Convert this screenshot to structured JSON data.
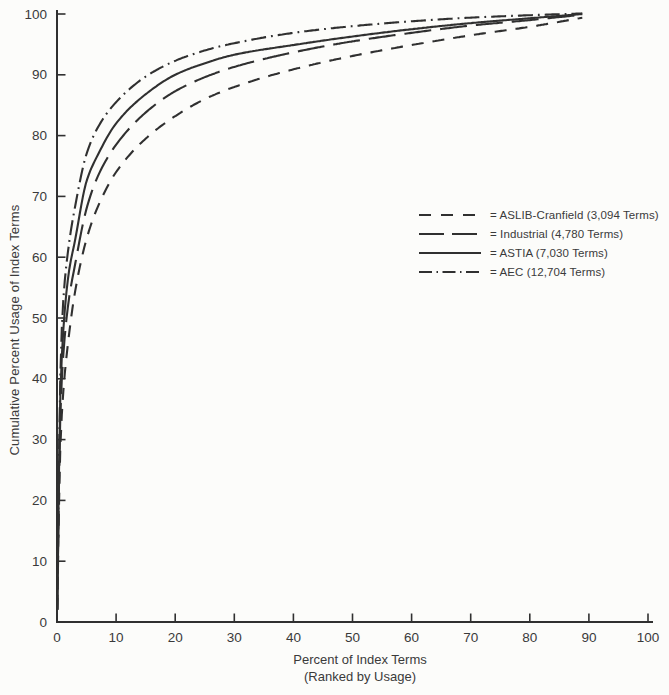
{
  "figure": {
    "background_color": "#fcfcfa",
    "ink_color": "#303030"
  },
  "chart_data": {
    "type": "line",
    "title": "",
    "xlabel": "Percent of Index Terms",
    "xlabel_note": "(Ranked by Usage)",
    "ylabel": "Cumulative Percent Usage of Index Terms",
    "xlim": [
      0,
      100
    ],
    "ylim": [
      0,
      100
    ],
    "x_ticks": [
      0,
      10,
      20,
      30,
      40,
      50,
      60,
      70,
      80,
      90,
      100
    ],
    "y_ticks": [
      0,
      10,
      20,
      30,
      40,
      50,
      60,
      70,
      80,
      90,
      100
    ],
    "grid": false,
    "legend_position": "center-right",
    "x": [
      0.05,
      0.5,
      1,
      2,
      3,
      5,
      7,
      10,
      15,
      20,
      25,
      30,
      40,
      50,
      60,
      70,
      80,
      89
    ],
    "series": [
      {
        "name": "ASLIB-Cranfield",
        "terms_count": "3,094",
        "legend_label": "= ASLIB-Cranfield (3,094 Terms)",
        "line_style": "short-dash",
        "values": [
          2,
          27,
          37,
          47,
          54,
          63,
          68.5,
          74,
          79.5,
          83.2,
          86,
          88,
          90.9,
          93.1,
          94.9,
          96.5,
          97.9,
          99.4
        ]
      },
      {
        "name": "Industrial",
        "terms_count": "4,780",
        "legend_label": "= Industrial (4,780 Terms)",
        "line_style": "long-dash",
        "values": [
          2,
          32,
          43,
          53,
          58.5,
          68,
          73.5,
          78.5,
          83.8,
          87.3,
          89.6,
          91.3,
          93.7,
          95.5,
          96.9,
          98.1,
          99,
          99.9
        ]
      },
      {
        "name": "ASTIA",
        "terms_count": "7,030",
        "legend_label": "= ASTIA (7,030 Terms)",
        "line_style": "solid",
        "values": [
          2,
          35,
          47,
          57.5,
          62.5,
          72.5,
          77,
          82,
          86.8,
          90,
          91.9,
          93.3,
          94.9,
          96.3,
          97.5,
          98.5,
          99.3,
          100
        ]
      },
      {
        "name": "AEC",
        "terms_count": "12,704",
        "legend_label": "= AEC (12,704 Terms)",
        "line_style": "dash-dot",
        "values": [
          2,
          38,
          52,
          62,
          68,
          77,
          81.5,
          85.5,
          89.7,
          92.3,
          94,
          95.2,
          96.9,
          98,
          98.8,
          99.4,
          99.8,
          100.1
        ]
      }
    ]
  }
}
